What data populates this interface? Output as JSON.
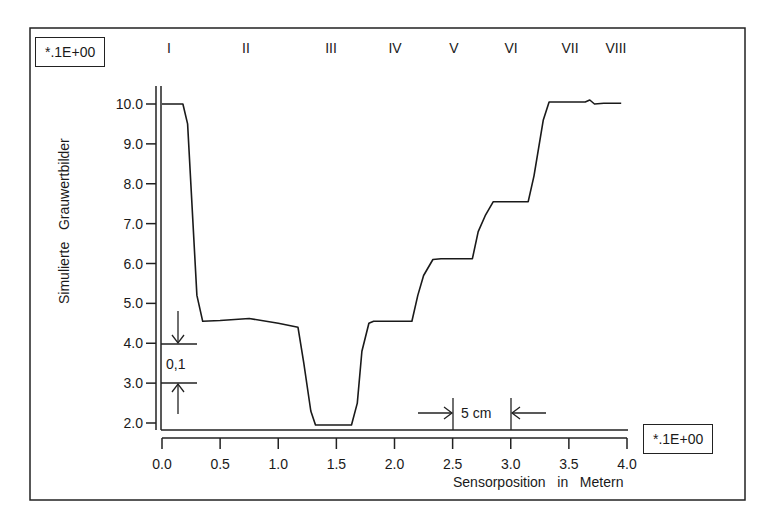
{
  "chart_data": {
    "type": "line",
    "title": "",
    "xlabel": "Sensorposition   in   Metern",
    "ylabel": "Simulierte   Grauwertbilder",
    "x_scale_label": "*.1E+00",
    "y_scale_label": "*.1E+00",
    "xlim": [
      0.0,
      4.0
    ],
    "ylim": [
      2.0,
      10.0
    ],
    "x_ticks": [
      "0.0",
      "0.5",
      "1.0",
      "1.5",
      "2.0",
      "2.5",
      "3.0",
      "3.5",
      "4.0"
    ],
    "y_ticks": [
      "10.0",
      "9.0",
      "8.0",
      "7.0",
      "6.0",
      "5.0",
      "4.0",
      "3.0",
      "2.0"
    ],
    "grid": false,
    "legend": null,
    "regions": [
      {
        "label": "I",
        "x": 0.1
      },
      {
        "label": "II",
        "x": 0.75
      },
      {
        "label": "III",
        "x": 1.5
      },
      {
        "label": "IV",
        "x": 2.0
      },
      {
        "label": "V",
        "x": 2.5
      },
      {
        "label": "VI",
        "x": 3.0
      },
      {
        "label": "VII",
        "x": 3.5
      },
      {
        "label": "VIII",
        "x": 3.9
      }
    ],
    "annotations": [
      {
        "text": "0,1",
        "type": "vertical-dimension",
        "from_y": 3.0,
        "to_y": 4.0,
        "x": 0.15
      },
      {
        "text": "5 cm",
        "type": "horizontal-dimension",
        "from_x": 2.5,
        "to_x": 3.0
      }
    ],
    "series": [
      {
        "name": "Simulierte Grauwertbilder",
        "x": [
          0.0,
          0.18,
          0.22,
          0.3,
          0.35,
          0.5,
          0.75,
          1.0,
          1.17,
          1.22,
          1.28,
          1.32,
          1.5,
          1.63,
          1.68,
          1.72,
          1.78,
          1.82,
          2.0,
          2.15,
          2.2,
          2.25,
          2.33,
          2.4,
          2.55,
          2.67,
          2.72,
          2.78,
          2.85,
          3.0,
          3.15,
          3.2,
          3.28,
          3.33,
          3.5,
          3.64,
          3.68,
          3.72,
          3.8,
          3.95
        ],
        "y": [
          10.0,
          10.0,
          9.5,
          5.2,
          4.55,
          4.57,
          4.62,
          4.5,
          4.4,
          3.5,
          2.3,
          1.95,
          1.95,
          1.95,
          2.5,
          3.8,
          4.5,
          4.55,
          4.55,
          4.55,
          5.2,
          5.7,
          6.1,
          6.12,
          6.12,
          6.12,
          6.8,
          7.2,
          7.55,
          7.55,
          7.55,
          8.2,
          9.6,
          10.05,
          10.05,
          10.05,
          10.1,
          10.0,
          10.02,
          10.02
        ]
      }
    ]
  },
  "labels": {
    "y_scale_box": "*.1E+00",
    "x_scale_box": "*.1E+00",
    "y_axis_title": "Simulierte   Grauwertbilder",
    "x_axis_title": "Sensorposition   in   Metern",
    "dim_vertical": "0,1",
    "dim_horizontal": "5 cm"
  },
  "colors": {
    "line": "#1a1a1a",
    "background": "#ffffff"
  }
}
